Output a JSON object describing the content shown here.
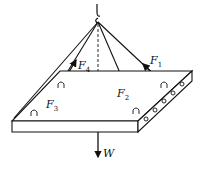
{
  "diagram": {
    "forces": [
      {
        "id": "F1",
        "label": "F",
        "sub": "1"
      },
      {
        "id": "F2",
        "label": "F",
        "sub": "2"
      },
      {
        "id": "F3",
        "label": "F",
        "sub": "3"
      },
      {
        "id": "F4",
        "label": "F",
        "sub": "4"
      }
    ],
    "weight": {
      "label": "W"
    },
    "colors": {
      "ink": "#111111",
      "background": "#ffffff"
    }
  }
}
